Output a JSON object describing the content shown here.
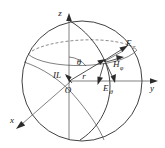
{
  "figure": {
    "type": "line-diagram",
    "background_color": "#ffffff",
    "line_color": "#2b2b2b",
    "label_color": "#1a1a1a"
  },
  "axes": {
    "z": {
      "label": "z",
      "direction": "up",
      "tip": {
        "x": 69,
        "y": 16
      }
    },
    "y": {
      "label": "y",
      "direction": "right",
      "tip": {
        "x": 155,
        "y": 81
      }
    },
    "x": {
      "label": "x",
      "direction": "down-left",
      "tip": {
        "x": 14,
        "y": 128
      }
    }
  },
  "origin": {
    "label": "O",
    "position": {
      "x": 70,
      "y": 84
    }
  },
  "source": {
    "label": "IL",
    "description": "infinitesimal current element at origin",
    "position": {
      "x": 58,
      "y": 74
    }
  },
  "angle": {
    "label": "θ",
    "description": "polar angle between z-axis and radius vector",
    "position": {
      "x": 78,
      "y": 62
    }
  },
  "radius": {
    "label": "r",
    "description": "radius vector from origin to field point",
    "position": {
      "x": 82,
      "y": 76
    }
  },
  "field_point": {
    "x": 105,
    "y": 60
  },
  "field_components": [
    {
      "name": "E-radial",
      "base": "E",
      "subscript": "r",
      "label": "E",
      "sub": "r",
      "label_x": 128,
      "label_y": 45,
      "direction": "outward-radial-up-right"
    },
    {
      "name": "H-phi",
      "base": "H",
      "subscript": "φ",
      "label": "H",
      "sub": "φ",
      "label_x": 116,
      "label_y": 66,
      "direction": "azimuthal-down-right"
    },
    {
      "name": "E-theta",
      "base": "E",
      "subscript": "θ",
      "label": "E",
      "sub": "θ",
      "label_x": 106,
      "label_y": 90,
      "direction": "tangential-down"
    }
  ],
  "sphere": {
    "center": {
      "x": 82,
      "y": 81
    },
    "radius": 60,
    "equator_style": "solid-ellipse-arc",
    "hidden_arc_style": "dashed"
  }
}
